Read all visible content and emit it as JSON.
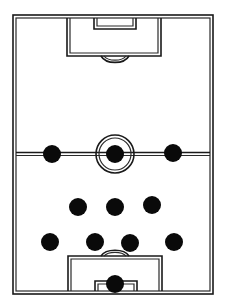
{
  "diagram": {
    "type": "football-formation",
    "formation": "1-4-3-3",
    "colors": {
      "lines": "#1a1a1a",
      "players": "#0a0a0a",
      "background": "#ffffff"
    },
    "pitch": {
      "outer": {
        "x": 13,
        "y": 15,
        "w": 200,
        "h": 279
      },
      "inner": {
        "x": 16,
        "y": 18,
        "w": 194,
        "h": 273
      },
      "halfway_y": 154,
      "center_circle": {
        "cx": 115,
        "cy": 154,
        "r": 19,
        "r_inner": 16
      }
    },
    "players": [
      {
        "role": "goalkeeper",
        "x": 115,
        "y": 284
      },
      {
        "role": "defender",
        "x": 50,
        "y": 242
      },
      {
        "role": "defender",
        "x": 95,
        "y": 242
      },
      {
        "role": "defender",
        "x": 130,
        "y": 243
      },
      {
        "role": "defender",
        "x": 174,
        "y": 242
      },
      {
        "role": "midfielder",
        "x": 78,
        "y": 207
      },
      {
        "role": "midfielder",
        "x": 115,
        "y": 207
      },
      {
        "role": "midfielder",
        "x": 152,
        "y": 205
      },
      {
        "role": "forward",
        "x": 52,
        "y": 154
      },
      {
        "role": "forward",
        "x": 115,
        "y": 154
      },
      {
        "role": "forward",
        "x": 173,
        "y": 153
      }
    ]
  }
}
